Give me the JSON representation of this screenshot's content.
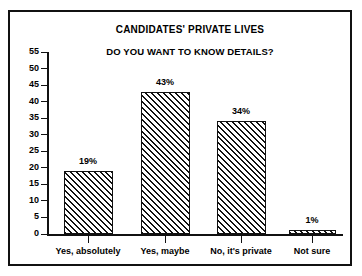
{
  "chart_data": {
    "type": "bar",
    "title": "CANDIDATES' PRIVATE LIVES",
    "subtitle": "DO YOU WANT TO KNOW DETAILS?",
    "xlabel": "",
    "ylabel": "",
    "categories": [
      "Yes, absolutely",
      "Yes, maybe",
      "No, it's private",
      "Not sure"
    ],
    "values": [
      19,
      43,
      34,
      1
    ],
    "data_labels": [
      "19%",
      "43%",
      "34%",
      "1%"
    ],
    "ylim": [
      0,
      55
    ],
    "yticks": [
      0,
      5,
      10,
      15,
      20,
      25,
      30,
      35,
      40,
      45,
      50,
      55
    ],
    "ytick_labels": [
      "0",
      "5",
      "10",
      "15",
      "20",
      "25",
      "30",
      "35",
      "40",
      "45",
      "50",
      "55"
    ],
    "grid": false,
    "legend": null,
    "bar_fill": "diagonal-hatch",
    "colors": {
      "ink": "#111111",
      "background": "#ffffff",
      "bar_fill": "#ffffff",
      "bar_hatch": "#111111"
    }
  }
}
